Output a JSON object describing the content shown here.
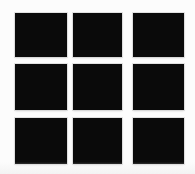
{
  "canvas": {
    "width": 195,
    "height": 174,
    "background_color": "#fcfcfc",
    "title": "3x3 black square grid"
  },
  "grid": {
    "rows": 3,
    "columns": 3,
    "tile_color": "#0a0a0a",
    "tile_border_halo_color": "#cdcdcd",
    "cells": [
      {
        "name": "cell-r1c1",
        "row": 1,
        "col": 1,
        "x": 15,
        "y": 13,
        "w": 52,
        "h": 44
      },
      {
        "name": "cell-r1c2",
        "row": 1,
        "col": 2,
        "x": 73,
        "y": 13,
        "w": 49,
        "h": 44
      },
      {
        "name": "cell-r1c3",
        "row": 1,
        "col": 3,
        "x": 133,
        "y": 13,
        "w": 51,
        "h": 44
      },
      {
        "name": "cell-r2c1",
        "row": 2,
        "col": 1,
        "x": 15,
        "y": 64,
        "w": 52,
        "h": 46
      },
      {
        "name": "cell-r2c2",
        "row": 2,
        "col": 2,
        "x": 73,
        "y": 64,
        "w": 49,
        "h": 46
      },
      {
        "name": "cell-r2c3",
        "row": 2,
        "col": 3,
        "x": 133,
        "y": 64,
        "w": 51,
        "h": 46
      },
      {
        "name": "cell-r3c1",
        "row": 3,
        "col": 1,
        "x": 15,
        "y": 118,
        "w": 52,
        "h": 46
      },
      {
        "name": "cell-r3c2",
        "row": 3,
        "col": 2,
        "x": 73,
        "y": 118,
        "w": 49,
        "h": 46
      },
      {
        "name": "cell-r3c3",
        "row": 3,
        "col": 3,
        "x": 133,
        "y": 118,
        "w": 51,
        "h": 46
      }
    ]
  }
}
